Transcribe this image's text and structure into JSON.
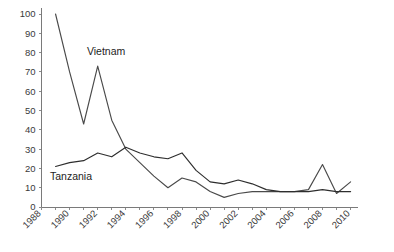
{
  "chart_data": {
    "type": "line",
    "title": "",
    "subtitle": "",
    "xlabel": "",
    "ylabel": "",
    "xlim": [
      1988,
      2010.5
    ],
    "ylim": [
      0,
      100
    ],
    "ytick_step": 10,
    "xtick_step": 1,
    "xtick_label_step": 2,
    "grid": false,
    "legend_position": "inline-annotation",
    "yticks": [
      0,
      10,
      20,
      30,
      40,
      50,
      60,
      70,
      80,
      90,
      100
    ],
    "ytick_labels": [
      "0",
      "10",
      "20",
      "30",
      "40",
      "50",
      "60",
      "70",
      "80",
      "90",
      "100"
    ],
    "xticks": [
      1988,
      1989,
      1990,
      1991,
      1992,
      1993,
      1994,
      1995,
      1996,
      1997,
      1998,
      1999,
      2000,
      2001,
      2002,
      2003,
      2004,
      2005,
      2006,
      2007,
      2008,
      2009,
      2010
    ],
    "xtick_labels": [
      "1988",
      "",
      "1990",
      "",
      "1992",
      "",
      "1994",
      "",
      "1996",
      "",
      "1998",
      "",
      "2000",
      "",
      "2002",
      "",
      "2004",
      "",
      "2006",
      "",
      "2008",
      "",
      "2010"
    ],
    "xtick_labels_shown": [
      "1988",
      "1990",
      "1992",
      "1994",
      "1996",
      "1998",
      "2000",
      "2002",
      "2004",
      "2006",
      "2008",
      "2010"
    ],
    "series": [
      {
        "name": "Vietnam",
        "color": "#4a4a4a",
        "label_x": 1992.6,
        "label_y": 79,
        "x": [
          1989,
          1990,
          1991,
          1992,
          1993,
          1994,
          1995,
          1996,
          1997,
          1998,
          1999,
          2000,
          2001,
          2002,
          2003,
          2004,
          2005,
          2006,
          2007,
          2008,
          2009,
          2010
        ],
        "values": [
          100,
          70,
          43,
          73,
          45,
          30,
          23,
          16,
          10,
          15,
          13,
          8,
          5,
          7,
          8,
          8,
          8,
          8,
          9,
          22,
          7,
          13
        ]
      },
      {
        "name": "Tanzania",
        "color": "#2e2e2e",
        "label_x": 1990.1,
        "label_y": 14,
        "x": [
          1989,
          1990,
          1991,
          1992,
          1993,
          1994,
          1995,
          1996,
          1997,
          1998,
          1999,
          2000,
          2001,
          2002,
          2003,
          2004,
          2005,
          2006,
          2007,
          2008,
          2009,
          2010
        ],
        "values": [
          21,
          23,
          24,
          28,
          26,
          31,
          28,
          26,
          25,
          28,
          19,
          13,
          12,
          14,
          12,
          9,
          8,
          8,
          8,
          9,
          8,
          8
        ]
      }
    ],
    "annotations": [
      {
        "text": "Vietnam",
        "x": 1992.6,
        "y": 79
      },
      {
        "text": "Tanzania",
        "x": 1990.1,
        "y": 14
      }
    ]
  }
}
